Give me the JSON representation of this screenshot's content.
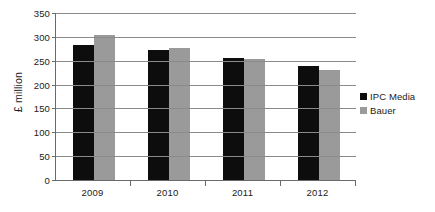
{
  "chart_data": {
    "type": "bar",
    "title": "",
    "subtitle": "",
    "xlabel": "",
    "ylabel": "£ million",
    "categories": [
      "2009",
      "2010",
      "2011",
      "2012"
    ],
    "series": [
      {
        "name": "IPC Media",
        "color": "#0d0d0d",
        "values": [
          284,
          273,
          256,
          240
        ]
      },
      {
        "name": "Bauer",
        "color": "#9a9a9a",
        "values": [
          304,
          276,
          253,
          231
        ]
      }
    ],
    "ylim": [
      0,
      350
    ],
    "yticks": [
      0,
      50,
      100,
      150,
      200,
      250,
      300,
      350
    ],
    "ytick_labels": [
      "0",
      "50",
      "100",
      "150",
      "200",
      "250",
      "300",
      "350"
    ],
    "grid": true,
    "grid_axis": "y",
    "legend_position": "right",
    "legend_entries": [
      "IPC Media",
      "Bauer"
    ],
    "annotations": []
  },
  "axes": {
    "y_title": "£ million"
  }
}
